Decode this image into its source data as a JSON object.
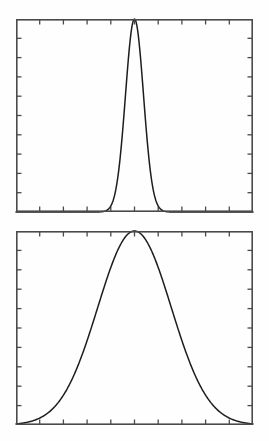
{
  "figure": {
    "background_color": "#ffffff",
    "axis_color": "#4a4a4a",
    "curve_color": "#1d1d1d",
    "panel_count": 2
  },
  "chart_data": [
    {
      "type": "line",
      "title": "",
      "subtitle": "",
      "xlabel": "",
      "ylabel": "",
      "name": "narrow-gaussian",
      "panel": "top",
      "grid": false,
      "legend": null,
      "annotations": [],
      "xlim": [
        0,
        10
      ],
      "ylim": [
        0,
        1
      ],
      "x_ticks": [
        1,
        2,
        3,
        4,
        5,
        6,
        7,
        8,
        9
      ],
      "y_ticks": [
        0.1,
        0.2,
        0.3,
        0.4,
        0.5,
        0.6,
        0.7,
        0.8,
        0.9
      ],
      "x_tick_labels": [],
      "y_tick_labels": [],
      "tick_direction": "in",
      "ticks_all_sides": true,
      "series": [
        {
          "name": "gaussian",
          "mean": 5.0,
          "sigma": 0.38,
          "peak": 1.0,
          "x": [
            0.0,
            0.25,
            0.5,
            0.75,
            1.0,
            1.25,
            1.5,
            1.75,
            2.0,
            2.25,
            2.5,
            2.75,
            3.0,
            3.25,
            3.5,
            3.6,
            3.7,
            3.8,
            3.9,
            4.0,
            4.1,
            4.2,
            4.3,
            4.4,
            4.5,
            4.6,
            4.7,
            4.8,
            4.9,
            5.0,
            5.1,
            5.2,
            5.3,
            5.4,
            5.5,
            5.6,
            5.7,
            5.8,
            5.9,
            6.0,
            6.1,
            6.2,
            6.3,
            6.4,
            6.5,
            6.75,
            7.0,
            7.25,
            7.5,
            7.75,
            8.0,
            8.25,
            8.5,
            8.75,
            9.0,
            9.25,
            9.5,
            9.75,
            10.0
          ],
          "y": [
            0.0,
            0.0,
            0.0,
            0.0,
            0.0,
            0.0,
            0.0,
            0.0,
            0.0,
            0.0,
            0.0,
            0.0,
            0.0,
            0.0,
            0.002,
            0.005,
            0.011,
            0.023,
            0.045,
            0.083,
            0.143,
            0.232,
            0.354,
            0.505,
            0.675,
            0.841,
            0.959,
            1.0,
            0.959,
            0.841,
            0.675,
            0.505,
            0.354,
            0.232,
            0.143,
            0.083,
            0.045,
            0.023,
            0.011,
            0.005,
            0.002,
            0.001,
            0.0,
            0.0,
            0.0,
            0.0,
            0.0,
            0.0,
            0.0,
            0.0,
            0.0,
            0.0,
            0.0,
            0.0,
            0.0,
            0.0,
            0.0,
            0.0,
            0.0
          ]
        }
      ]
    },
    {
      "type": "line",
      "title": "",
      "subtitle": "",
      "xlabel": "",
      "ylabel": "",
      "name": "wide-gaussian",
      "panel": "bottom",
      "grid": false,
      "legend": null,
      "annotations": [],
      "xlim": [
        0,
        10
      ],
      "ylim": [
        0,
        1
      ],
      "x_ticks": [
        1,
        2,
        3,
        4,
        5,
        6,
        7,
        8,
        9
      ],
      "y_ticks": [
        0.1,
        0.2,
        0.3,
        0.4,
        0.5,
        0.6,
        0.7,
        0.8,
        0.9
      ],
      "x_tick_labels": [],
      "y_tick_labels": [],
      "tick_direction": "in",
      "ticks_all_sides": true,
      "series": [
        {
          "name": "gaussian",
          "mean": 5.0,
          "sigma": 1.55,
          "peak": 1.0,
          "x": [
            0.0,
            0.25,
            0.5,
            0.75,
            1.0,
            1.25,
            1.5,
            1.75,
            2.0,
            2.25,
            2.5,
            2.75,
            3.0,
            3.25,
            3.5,
            3.75,
            4.0,
            4.25,
            4.5,
            4.75,
            5.0,
            5.25,
            5.5,
            5.75,
            6.0,
            6.25,
            6.5,
            6.75,
            7.0,
            7.25,
            7.5,
            7.75,
            8.0,
            8.25,
            8.5,
            8.75,
            9.0,
            9.25,
            9.5,
            9.75,
            10.0
          ],
          "y": [
            0.006,
            0.012,
            0.021,
            0.035,
            0.056,
            0.085,
            0.125,
            0.177,
            0.242,
            0.32,
            0.408,
            0.503,
            0.599,
            0.691,
            0.773,
            0.87,
            0.92,
            0.97,
            0.992,
            1.0,
            1.0,
            0.992,
            0.97,
            0.92,
            0.87,
            0.773,
            0.691,
            0.599,
            0.503,
            0.408,
            0.32,
            0.242,
            0.177,
            0.125,
            0.085,
            0.056,
            0.035,
            0.021,
            0.012,
            0.006,
            0.003
          ]
        }
      ]
    }
  ]
}
